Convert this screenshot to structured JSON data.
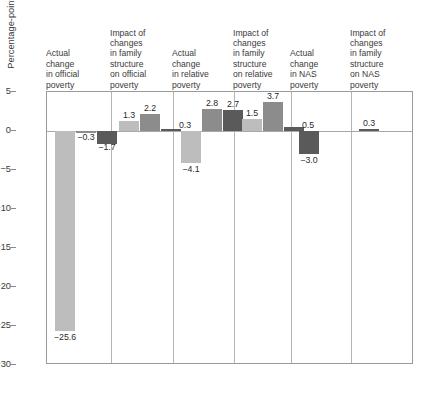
{
  "chart_data": {
    "type": "bar",
    "title": "",
    "subtitle": "",
    "xlabel": "",
    "ylabel": "Percentage-point change in poverty rate",
    "ylim": [
      -30,
      5
    ],
    "ytick_values": [
      5,
      0,
      -5,
      -10,
      -15,
      -20,
      -25,
      -30
    ],
    "ytick_labels": [
      "5",
      "0",
      "−5",
      "−10",
      "−15",
      "−20",
      "−25",
      "−30"
    ],
    "grid": false,
    "legend_position": "bottom-right",
    "categories": [
      "Actual change in official poverty",
      "Impact of changes in family structure on official poverty",
      "Actual change in relative poverty",
      "Impact of changes in family structure on relative poverty",
      "Actual change in NAS poverty",
      "Impact of changes in family structure on NAS poverty"
    ],
    "series": [
      {
        "name": "1949–1969",
        "color": "#bdbdbd",
        "values": [
          -25.6,
          1.3,
          -4.1,
          1.5,
          null,
          null
        ]
      },
      {
        "name": "1969–1990",
        "color": "#8c8c8c",
        "values": [
          -0.3,
          2.2,
          2.8,
          3.7,
          null,
          null
        ]
      },
      {
        "name": "1990–1999",
        "color": "#5a5a5a",
        "values": [
          -1.7,
          0.3,
          2.7,
          0.5,
          -3.0,
          0.3
        ]
      }
    ],
    "data_labels": [
      [
        "−25.6",
        "1.3",
        "−4.1",
        "1.5",
        "",
        ""
      ],
      [
        "−0.3",
        "2.2",
        "2.8",
        "3.7",
        "",
        ""
      ],
      [
        "−1.7",
        "0.3",
        "2.7",
        "0.5",
        "−3.0",
        "0.3"
      ]
    ]
  },
  "column_headers": [
    {
      "lines": [
        "Actual",
        "change",
        "in official",
        "poverty"
      ]
    },
    {
      "lines": [
        "Impact of",
        "changes",
        "in family",
        "structure",
        "on official",
        "poverty"
      ]
    },
    {
      "lines": [
        "Actual",
        "change",
        "in relative",
        "poverty"
      ]
    },
    {
      "lines": [
        "Impact of",
        "changes",
        "in family",
        "structure",
        "on relative",
        "poverty"
      ]
    },
    {
      "lines": [
        "Actual",
        "change",
        "in NAS",
        "poverty"
      ]
    },
    {
      "lines": [
        "Impact of",
        "changes",
        "in family",
        "structure",
        "on NAS",
        "poverty"
      ]
    }
  ],
  "legend": {
    "items": [
      {
        "label": "1949–1969",
        "color": "#bdbdbd"
      },
      {
        "label": "1969–1990",
        "color": "#8c8c8c"
      },
      {
        "label": "1990–1999",
        "color": "#5a5a5a"
      }
    ]
  },
  "colors": {
    "series_light": "#bdbdbd",
    "series_medium": "#8c8c8c",
    "series_dark": "#5a5a5a",
    "frame": "#9a9a9a",
    "separator": "#b5b5b5",
    "text": "#2b2b2b",
    "background": "#ffffff"
  }
}
